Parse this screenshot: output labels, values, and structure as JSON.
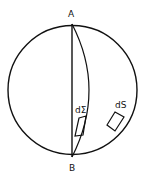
{
  "diagram": {
    "labels": {
      "top_point": "A",
      "bottom_point": "B",
      "surface_element_sigma": "dΣ",
      "surface_element_s": "dS"
    },
    "colors": {
      "stroke": "#111111",
      "background": "#ffffff"
    }
  }
}
